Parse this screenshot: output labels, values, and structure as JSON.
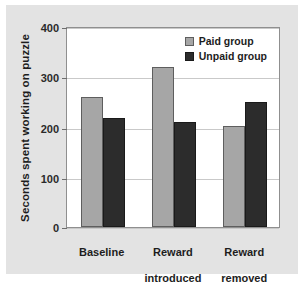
{
  "chart_data": {
    "type": "bar",
    "title": "",
    "subtitle": "",
    "xlabel": "",
    "ylabel": "Seconds spent working on puzzle",
    "ylim": [
      0,
      400
    ],
    "yticks": [
      0,
      100,
      200,
      300,
      400
    ],
    "ytick_labels": [
      "0",
      "100",
      "200",
      "300",
      "400"
    ],
    "grid": true,
    "legend_position": "top-right-inside",
    "categories": [
      "Baseline",
      "Reward introduced",
      "Reward removed"
    ],
    "category_lines": [
      [
        "Baseline"
      ],
      [
        "Reward",
        "introduced"
      ],
      [
        "Reward",
        "removed"
      ]
    ],
    "series": [
      {
        "name": "Paid group",
        "color": "#a6a6a6",
        "edge_color": "#5e5e5e",
        "values": [
          260,
          320,
          202
        ]
      },
      {
        "name": "Unpaid group",
        "color": "#2c2c2c",
        "edge_color": "#1a1a1a",
        "values": [
          218,
          210,
          251
        ]
      }
    ]
  },
  "figure": {
    "background_color": "#e3e3e3",
    "plot_background_color": "#ffffff",
    "axis_color": "#8f8f8f",
    "gridline_color": "#c9c9c9"
  },
  "legend": {
    "items": [
      {
        "label": "Paid group"
      },
      {
        "label": "Unpaid group"
      }
    ]
  },
  "axes": {
    "y_title": "Seconds spent working on puzzle",
    "y_tick_0": "0",
    "y_tick_1": "100",
    "y_tick_2": "200",
    "y_tick_3": "300",
    "y_tick_4": "400"
  },
  "x_labels": {
    "g0_line0": "Baseline",
    "g0_line1": "",
    "g1_line0": "Reward",
    "g1_line1": "introduced",
    "g2_line0": "Reward",
    "g2_line1": "removed"
  }
}
